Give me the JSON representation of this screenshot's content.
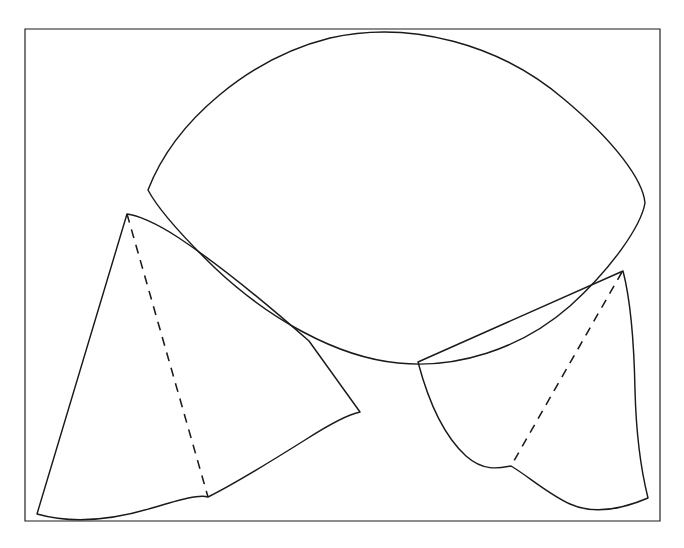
{
  "figure": {
    "kind": "geometric-line-drawing",
    "title": "",
    "caption": "",
    "canvas": {
      "width": 684,
      "height": 548
    },
    "background_color": "#ffffff",
    "ink_color": "#1a1a1a",
    "frame": {
      "name": "outer-rectangle-border",
      "style": "solid",
      "stroke_width": 1.15,
      "points": [
        [
          25,
          29
        ],
        [
          660,
          29
        ],
        [
          660,
          521
        ],
        [
          25,
          521
        ]
      ],
      "closed": true
    },
    "shapes": [
      {
        "id": "upper-lens-surface",
        "label": "large curved lens-shaped surface",
        "style": "solid",
        "stroke_width": 1.45,
        "path": "M 148 190 C 175 120 250 58 330 38 C 410 20 500 44 565 100 C 615 142 643 180 645 203 C 641 226 612 268 570 306 C 520 350 455 369 398 363 C 336 357 268 318 215 268 C 180 234 158 209 148 190 Z",
        "closed": true
      },
      {
        "id": "left-cone-surface",
        "label": "left cone with curved base and straight ruling",
        "style": "solid",
        "stroke_width": 1.45,
        "path": "M 127 214 L 37 514 C 72 524 112 520 152 508 C 182 499 200 494 208 497 C 228 487 270 462 305 440 C 330 424 350 414 360 412 L 309 341 C 268 305 215 262 179 238 C 155 222 136 215 127 214 Z",
        "closed": true
      },
      {
        "id": "right-cone-surface",
        "label": "right cone with curved base and straight ruling",
        "style": "solid",
        "stroke_width": 1.45,
        "path": "M 623 271 L 418 362 C 428 400 444 436 466 456 C 484 472 500 468 511 466 C 528 476 548 494 570 504 C 592 514 620 510 648 498 C 641 470 636 430 635 390 C 634 340 630 298 623 271 Z",
        "closed": true
      }
    ],
    "dashed_edges": [
      {
        "id": "left-cone-hidden-ruling",
        "label": "hidden ruling line of left cone",
        "style": "dashed",
        "dash_pattern": "9 7",
        "path": "M 127 214 L 208 497"
      },
      {
        "id": "right-cone-hidden-ruling",
        "label": "hidden ruling line of right cone",
        "style": "dashed",
        "dash_pattern": "9 7",
        "path": "M 622 272 L 511 466"
      }
    ],
    "vertices": [
      {
        "id": "lens-left-corner",
        "x": 148,
        "y": 190
      },
      {
        "id": "lens-right-corner",
        "x": 645,
        "y": 203
      },
      {
        "id": "left-cone-apex",
        "x": 127,
        "y": 214
      },
      {
        "id": "left-cone-base-left",
        "x": 37,
        "y": 514
      },
      {
        "id": "left-cone-base-cusp",
        "x": 208,
        "y": 497
      },
      {
        "id": "left-cone-right-corner",
        "x": 360,
        "y": 412
      },
      {
        "id": "right-cone-apex",
        "x": 623,
        "y": 271
      },
      {
        "id": "right-cone-left-corner",
        "x": 418,
        "y": 362
      },
      {
        "id": "right-cone-base-cusp",
        "x": 511,
        "y": 466
      },
      {
        "id": "right-cone-base-right",
        "x": 648,
        "y": 498
      }
    ]
  }
}
